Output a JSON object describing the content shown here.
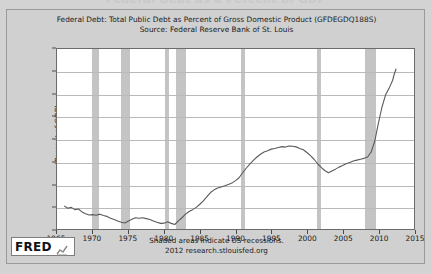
{
  "page": {
    "clipped_headline": "Federal Debt as a Percent of GDP",
    "background_color": "#d3d3d3",
    "frame_color": "#d0d0d0"
  },
  "logo": {
    "word": "FRED",
    "mark_icon": "line-chart-icon"
  },
  "footer": {
    "line1": "Shaded areas indicate US recessions.",
    "line2": "2012 research.stlouisfed.org"
  },
  "chart_data": {
    "type": "line",
    "title": "Federal Debt: Total Public Debt as Percent of Gross Domestic Product (GFDEGDQ188S)",
    "subtitle": "Source: Federal Reserve Bank of St. Louis",
    "xlabel": "",
    "ylabel": "(Percent of GDP)",
    "xlim": [
      1965,
      2015
    ],
    "ylim": [
      30,
      110
    ],
    "ytick_step": 10,
    "xtick_step": 5,
    "grid": true,
    "legend": "none",
    "line_color": "#5a5a5a",
    "band_color": "#c4c4c4",
    "yticks": [
      30,
      40,
      50,
      60,
      70,
      80,
      90,
      100,
      110
    ],
    "xticks": [
      1965,
      1970,
      1975,
      1980,
      1985,
      1990,
      1995,
      2000,
      2005,
      2010,
      2015
    ],
    "annotations": [
      "Shaded areas indicate US recessions."
    ],
    "recessions": [
      {
        "start": 1969.92,
        "end": 1970.92
      },
      {
        "start": 1973.92,
        "end": 1975.17
      },
      {
        "start": 1980.08,
        "end": 1980.58
      },
      {
        "start": 1981.58,
        "end": 1982.92
      },
      {
        "start": 1990.58,
        "end": 1991.17
      },
      {
        "start": 2001.17,
        "end": 2001.83
      },
      {
        "start": 2007.92,
        "end": 2009.42
      }
    ],
    "x": [
      1966.0,
      1966.5,
      1967.0,
      1967.5,
      1968.0,
      1968.5,
      1969.0,
      1969.5,
      1970.0,
      1970.5,
      1971.0,
      1971.5,
      1972.0,
      1972.5,
      1973.0,
      1973.5,
      1974.0,
      1974.5,
      1975.0,
      1975.5,
      1976.0,
      1976.5,
      1977.0,
      1977.5,
      1978.0,
      1978.5,
      1979.0,
      1979.5,
      1980.0,
      1980.5,
      1981.0,
      1981.5,
      1982.0,
      1982.5,
      1983.0,
      1983.5,
      1984.0,
      1984.5,
      1985.0,
      1985.5,
      1986.0,
      1986.5,
      1987.0,
      1987.5,
      1988.0,
      1988.5,
      1989.0,
      1989.5,
      1990.0,
      1990.5,
      1991.0,
      1991.5,
      1992.0,
      1992.5,
      1993.0,
      1993.5,
      1994.0,
      1994.5,
      1995.0,
      1995.5,
      1996.0,
      1996.5,
      1997.0,
      1997.5,
      1998.0,
      1998.5,
      1999.0,
      1999.5,
      2000.0,
      2000.5,
      2001.0,
      2001.5,
      2002.0,
      2002.5,
      2003.0,
      2003.5,
      2004.0,
      2004.5,
      2005.0,
      2005.5,
      2006.0,
      2006.5,
      2007.0,
      2007.5,
      2008.0,
      2008.5,
      2009.0,
      2009.5,
      2010.0,
      2010.5,
      2011.0,
      2011.5,
      2012.0,
      2012.25
    ],
    "values": [
      40.3,
      39.2,
      39.6,
      38.6,
      38.9,
      37.6,
      36.8,
      36.2,
      36.4,
      36.1,
      36.6,
      36.0,
      35.6,
      34.8,
      34.2,
      33.6,
      33.0,
      32.7,
      33.6,
      34.3,
      35.0,
      34.8,
      35.0,
      34.6,
      34.2,
      33.6,
      33.0,
      32.5,
      32.6,
      33.2,
      32.5,
      32.0,
      33.6,
      35.0,
      36.6,
      37.8,
      38.6,
      39.6,
      41.0,
      42.5,
      44.4,
      46.2,
      47.4,
      48.2,
      48.7,
      49.2,
      49.8,
      50.4,
      51.5,
      52.8,
      55.0,
      57.0,
      58.8,
      60.5,
      62.0,
      63.2,
      64.2,
      64.8,
      65.5,
      65.8,
      66.2,
      66.6,
      66.4,
      66.9,
      66.8,
      66.5,
      65.8,
      65.2,
      64.0,
      62.6,
      61.0,
      59.0,
      57.4,
      56.0,
      55.0,
      55.8,
      56.6,
      57.5,
      58.2,
      59.0,
      59.6,
      60.2,
      60.6,
      61.0,
      61.4,
      62.0,
      64.2,
      69.0,
      76.8,
      84.0,
      89.4,
      92.5,
      96.0,
      99.0
    ],
    "final_value": 101.2
  }
}
